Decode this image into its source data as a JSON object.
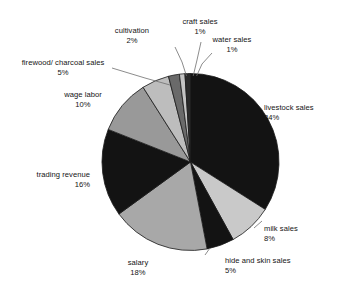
{
  "chart_data": {
    "type": "pie",
    "title": "",
    "subtitle": "",
    "xlabel": "",
    "ylabel": "",
    "legend_position": "none",
    "grid": false,
    "value_unit": "percent",
    "start_angle_deg": 0,
    "direction": "clockwise",
    "categories": [
      "livestock sales",
      "milk sales",
      "hide and skin sales",
      "salary",
      "trading revenue",
      "wage labor",
      "firewood/ charcoal sales",
      "cultivation",
      "craft sales",
      "water sales"
    ],
    "values": [
      34,
      8,
      5,
      18,
      16,
      10,
      5,
      2,
      1,
      1
    ],
    "value_labels": [
      "34%",
      "8%",
      "5%",
      "18%",
      "16%",
      "10%",
      "5%",
      "2%",
      "1%",
      "1%"
    ],
    "colors": [
      "#131313",
      "#c9c9c9",
      "#131313",
      "#a8a8a8",
      "#131313",
      "#999999",
      "#bdbdbd",
      "#6a6a6a",
      "#c4c4c4",
      "#2a2a2a"
    ],
    "slices": [
      {
        "name": "livestock sales",
        "value": 34,
        "label": "livestock sales",
        "percent_text": "34%",
        "color": "#131313"
      },
      {
        "name": "milk sales",
        "value": 8,
        "label": "milk sales",
        "percent_text": "8%",
        "color": "#c9c9c9"
      },
      {
        "name": "hide and skin sales",
        "value": 5,
        "label": "hide and skin sales",
        "percent_text": "5%",
        "color": "#131313"
      },
      {
        "name": "salary",
        "value": 18,
        "label": "salary",
        "percent_text": "18%",
        "color": "#a8a8a8"
      },
      {
        "name": "trading revenue",
        "value": 16,
        "label": "trading revenue",
        "percent_text": "16%",
        "color": "#131313"
      },
      {
        "name": "wage labor",
        "value": 10,
        "label": "wage labor",
        "percent_text": "10%",
        "color": "#999999"
      },
      {
        "name": "firewood/ charcoal sales",
        "value": 5,
        "label": "firewood/ charcoal sales",
        "percent_text": "5%",
        "color": "#bdbdbd"
      },
      {
        "name": "cultivation",
        "value": 2,
        "label": "cultivation",
        "percent_text": "2%",
        "color": "#6a6a6a"
      },
      {
        "name": "craft sales",
        "value": 1,
        "label": "craft sales",
        "percent_text": "1%",
        "color": "#c4c4c4"
      },
      {
        "name": "water sales",
        "value": 1,
        "label": "water sales",
        "percent_text": "1%",
        "color": "#2a2a2a"
      }
    ]
  },
  "labels": {
    "livestock": {
      "name": "livestock sales",
      "pct": "34%"
    },
    "milk": {
      "name": "milk sales",
      "pct": "8%"
    },
    "hide": {
      "name": "hide and skin sales",
      "pct": "5%"
    },
    "salary": {
      "name": "salary",
      "pct": "18%"
    },
    "trading": {
      "name": "trading revenue",
      "pct": "16%"
    },
    "wage": {
      "name": "wage labor",
      "pct": "10%"
    },
    "firewood": {
      "name": "firewood/ charcoal sales",
      "pct": "5%"
    },
    "cultivation": {
      "name": "cultivation",
      "pct": "2%"
    },
    "craft": {
      "name": "craft sales",
      "pct": "1%"
    },
    "water": {
      "name": "water sales",
      "pct": "1%"
    }
  }
}
